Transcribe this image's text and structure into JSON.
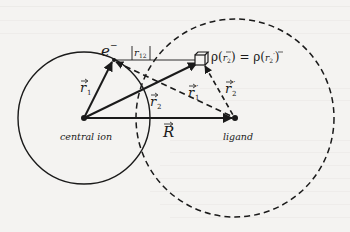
{
  "figure": {
    "labels": {
      "electron": "e",
      "electron_charge": "−",
      "r12": "|r₁₂|",
      "r12_text": "r",
      "r12_sub": "12",
      "r1": "r",
      "r1_sub": "1",
      "r2": "r",
      "r2_sub": "2",
      "r1_prime": "r",
      "r1_prime_sub": "1",
      "r1_prime_mark": "′",
      "r2_prime": "r",
      "r2_prime_sub": "2",
      "r2_prime_mark": "′",
      "R": "R",
      "density_eq": "ρ(r₂) = ρ(r₂′)",
      "density_lhs": "ρ(",
      "density_mid": ") = ρ(",
      "density_rhs": ")",
      "central_ion": "central ion",
      "ligand": "ligand"
    },
    "colors": {
      "ink": "#1a1a1a",
      "background": "#f4f3f1"
    }
  }
}
